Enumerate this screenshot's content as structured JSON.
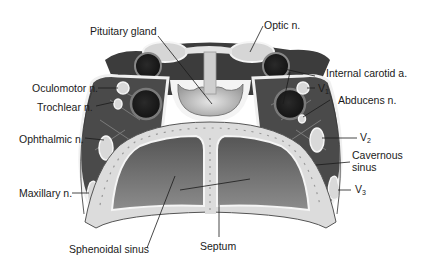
{
  "diagram": {
    "colors": {
      "background": "#ffffff",
      "dark_tissue": "#3a3a3a",
      "mid_gray": "#8a8a8a",
      "light_structure": "#d8d8d8",
      "bone": "#dcdcdc",
      "sinus_cavity": "#6e6e6e",
      "label_text": "#1a1a1a"
    },
    "labels": {
      "pituitary_gland": "Pituitary gland",
      "optic_n": "Optic n.",
      "internal_carotid_a": "Internal carotid a.",
      "oculomotor_n": "Oculomotor n.",
      "v1_base": "V",
      "v1_sub": "1",
      "trochlear_n": "Trochlear n.",
      "abducens_n": "Abducens n.",
      "ophthalmic_n": "Ophthalmic n.",
      "v2_base": "V",
      "v2_sub": "2",
      "cavernous_sinus_line1": "Cavernous",
      "cavernous_sinus_line2": "sinus",
      "maxillary_n": "Maxillary n.",
      "v3_base": "V",
      "v3_sub": "3",
      "sphenoidal_sinus": "Sphenoidal sinus",
      "septum": "Septum"
    }
  }
}
